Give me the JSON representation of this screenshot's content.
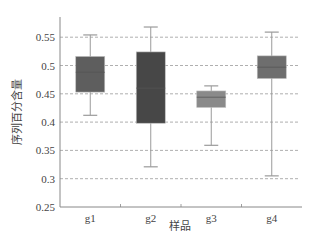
{
  "chart_data": {
    "type": "boxplot",
    "title": "",
    "xlabel": "样品",
    "ylabel": "序列百分含量",
    "ylim": [
      0.25,
      0.58
    ],
    "yticks": [
      0.25,
      0.3,
      0.35,
      0.4,
      0.45,
      0.5,
      0.55
    ],
    "ytick_labels": [
      "0.25",
      "0.3",
      "0.35",
      "0.4",
      "0.45",
      "0.5",
      "0.55"
    ],
    "grid": {
      "axis": "y",
      "style": "dashed",
      "lines": [
        0.3,
        0.35,
        0.4,
        0.45,
        0.5,
        0.55
      ]
    },
    "legend": null,
    "categories": [
      "g1",
      "g2",
      "g3",
      "g4"
    ],
    "boxes": [
      {
        "name": "g1",
        "whisker_low": 0.412,
        "q1": 0.453,
        "median": 0.488,
        "q3": 0.516,
        "whisker_high": 0.554,
        "color": "#5e5e5e"
      },
      {
        "name": "g2",
        "whisker_low": 0.321,
        "q1": 0.398,
        "median": 0.46,
        "q3": 0.524,
        "whisker_high": 0.568,
        "color": "#474747"
      },
      {
        "name": "g3",
        "whisker_low": 0.359,
        "q1": 0.426,
        "median": 0.444,
        "q3": 0.455,
        "whisker_high": 0.464,
        "color": "#8a8a8a"
      },
      {
        "name": "g4",
        "whisker_low": 0.305,
        "q1": 0.477,
        "median": 0.497,
        "q3": 0.517,
        "whisker_high": 0.559,
        "color": "#6e6e6e"
      }
    ]
  },
  "colors": {
    "axis": "#888888",
    "grid": "#9a9a9a",
    "whisker": "#9a9a9a",
    "background": "#ffffff"
  }
}
